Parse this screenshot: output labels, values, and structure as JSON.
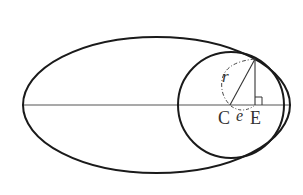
{
  "diagram": {
    "type": "geometry",
    "labels": {
      "center": "C",
      "foot": "E",
      "radius": "r",
      "distance": "e"
    },
    "colors": {
      "stroke": "#1a1a1a",
      "axis": "#555555",
      "text": "#333333",
      "background": "#ffffff"
    },
    "shapes": {
      "ellipse": {
        "cx": 156.5,
        "cy": 105,
        "rx": 133.5,
        "ry": 68
      },
      "circle": {
        "cx": 231,
        "cy": 105,
        "r": 53
      },
      "axis": {
        "x1": 22,
        "y1": 105,
        "x2": 291,
        "y2": 105
      },
      "tangent_point": {
        "x": 255,
        "y": 59
      },
      "point_C": {
        "x": 230,
        "y": 105
      },
      "point_E": {
        "x": 255,
        "y": 105
      }
    }
  }
}
